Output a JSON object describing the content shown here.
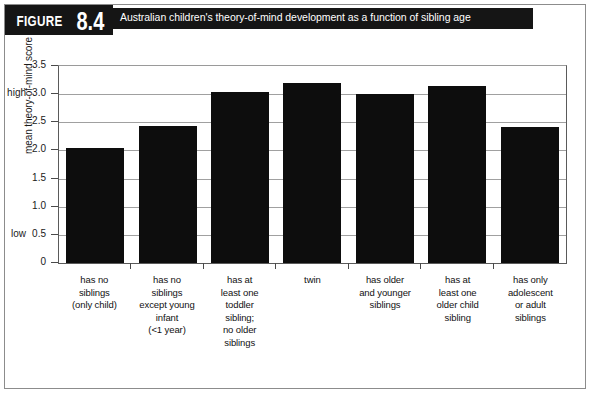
{
  "figure": {
    "label": "FIGURE",
    "number": "8.4",
    "title": "Australian children's theory-of-mind development as a function of sibling age"
  },
  "axis": {
    "y_anchor_high": "high",
    "y_anchor_low": "low",
    "y_title": "mean theory-of-mind score"
  },
  "chart_data": {
    "type": "bar",
    "title": "Australian children's theory-of-mind development as a function of sibling age",
    "xlabel": "",
    "ylabel": "mean theory-of-mind score",
    "ylim": [
      0,
      3.5
    ],
    "yticks": [
      0,
      0.5,
      1.0,
      1.5,
      2.0,
      2.5,
      3.0,
      3.5
    ],
    "ytick_labels": [
      "0",
      "0.5",
      "1.0",
      "1.5",
      "2.0",
      "2.5",
      "3.0",
      "3.5"
    ],
    "y_anchors": [
      {
        "label": "high",
        "value": 3.0
      },
      {
        "label": "low",
        "value": 0.5
      }
    ],
    "grid": true,
    "legend": "none",
    "bar_color": "#0d0d0d",
    "categories": [
      "has no siblings (only child)",
      "has no siblings except young infant (<1 year)",
      "has at least one toddler sibling; no older siblings",
      "twin",
      "has older and younger siblings",
      "has at least one older child sibling",
      "has only adolescent or adult siblings"
    ],
    "category_lines": [
      [
        "has no",
        "siblings",
        "(only child)"
      ],
      [
        "has no",
        "siblings",
        "except young",
        "infant",
        "(<1 year)"
      ],
      [
        "has at",
        "least one",
        "toddler",
        "sibling;",
        "no older",
        "siblings"
      ],
      [
        "twin"
      ],
      [
        "has older",
        "and younger",
        "siblings"
      ],
      [
        "has at",
        "least one",
        "older child",
        "sibling"
      ],
      [
        "has only",
        "adolescent",
        "or adult",
        "siblings"
      ]
    ],
    "values": [
      2.05,
      2.43,
      3.03,
      3.2,
      3.0,
      3.14,
      2.41
    ]
  }
}
